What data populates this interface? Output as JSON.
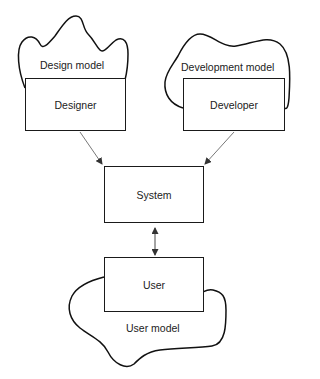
{
  "diagram": {
    "type": "mental-models",
    "nodes": {
      "designer": {
        "label": "Designer"
      },
      "developer": {
        "label": "Developer"
      },
      "system": {
        "label": "System"
      },
      "user": {
        "label": "User"
      }
    },
    "regions": {
      "design_model": {
        "label": "Design model"
      },
      "development_model": {
        "label": "Development model"
      },
      "user_model": {
        "label": "User model"
      }
    },
    "edges": [
      {
        "from": "designer",
        "to": "system",
        "direction": "forward"
      },
      {
        "from": "developer",
        "to": "system",
        "direction": "forward"
      },
      {
        "from": "system",
        "to": "user",
        "direction": "bidirectional"
      }
    ],
    "colors": {
      "stroke": "#1a1a1a",
      "arrow": "#555555",
      "background": "#ffffff"
    }
  }
}
